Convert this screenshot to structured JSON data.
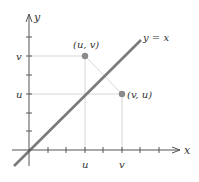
{
  "diagram": {
    "axes": {
      "x_label": "x",
      "y_label": "y",
      "x_tick_labels": {
        "u": "u",
        "v": "v"
      },
      "y_tick_labels": {
        "u": "u",
        "v": "v"
      }
    },
    "line": {
      "label": "y = x",
      "color": "#7a7a7a"
    },
    "points": [
      {
        "label": "(u, v)",
        "color": "#8a8a8a"
      },
      {
        "label": "(v, u)",
        "color": "#8a8a8a"
      }
    ],
    "colors": {
      "axis": "#555555",
      "guide": "#cfcfcf",
      "reflection_segment": "#cfcfcf"
    }
  }
}
